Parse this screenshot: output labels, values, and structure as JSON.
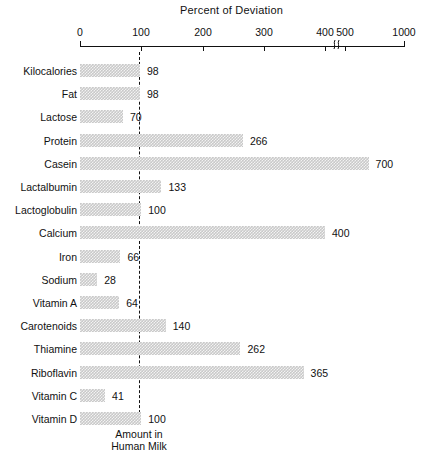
{
  "chart_data": {
    "type": "bar",
    "orientation": "horizontal",
    "title": "Percent of Deviation",
    "xlabel": "",
    "ylabel": "",
    "grid": false,
    "legend": "none",
    "axis_break": {
      "after": 400,
      "before": 500,
      "symbol": "break-squiggle"
    },
    "tick_labels": [
      "0",
      "100",
      "200",
      "300",
      "400",
      "500",
      "1000"
    ],
    "tick_values": [
      0,
      100,
      200,
      300,
      400,
      500,
      1000
    ],
    "xlim": [
      0,
      1000
    ],
    "reference_line": {
      "value": 100,
      "label_line1": "Amount in",
      "label_line2": "Human Milk",
      "style": "dashed"
    },
    "categories": [
      "Kilocalories",
      "Fat",
      "Lactose",
      "Protein",
      "Casein",
      "Lactalbumin",
      "Lactoglobulin",
      "Calcium",
      "Iron",
      "Sodium",
      "Vitamin A",
      "Carotenoids",
      "Thiamine",
      "Riboflavin",
      "Vitamin C",
      "Vitamin D"
    ],
    "values": [
      98,
      98,
      70,
      266,
      700,
      133,
      100,
      400,
      66,
      28,
      64,
      140,
      262,
      365,
      41,
      100
    ],
    "value_labels": [
      "98",
      "98",
      "70",
      "266",
      "700",
      "133",
      "100",
      "400",
      "66",
      "28",
      "64",
      "140",
      "262",
      "365",
      "41",
      "100"
    ],
    "bar_color": "#c9c9c9",
    "bar_pattern": "dotted-hatch"
  }
}
